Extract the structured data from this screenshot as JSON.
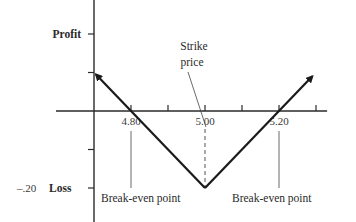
{
  "chart_data": {
    "type": "line",
    "title": "",
    "xlabel": "",
    "ylabel": "",
    "x_tick_labels": [
      {
        "value": 4.8,
        "label": "4.80"
      },
      {
        "value": 5.0,
        "label": "5.00"
      },
      {
        "value": 5.2,
        "label": "5.20"
      }
    ],
    "x_ticks": [
      4.7,
      4.8,
      4.9,
      5.0,
      5.1,
      5.2,
      5.3
    ],
    "y_ticks": [
      0.2,
      0.1,
      -0.1,
      -0.2
    ],
    "y_axis_labels": {
      "profit": {
        "value": 0.2,
        "label": "Profit"
      },
      "loss": {
        "value": -0.2,
        "label": "Loss",
        "number": "–.20"
      }
    },
    "xlim": [
      4.7,
      5.33
    ],
    "ylim": [
      -0.29,
      0.29
    ],
    "series": [
      {
        "name": "Straddle payoff",
        "x": [
          4.7,
          5.0,
          5.29
        ],
        "y": [
          0.1,
          -0.2,
          0.09
        ],
        "arrows_at_ends": true
      }
    ],
    "annotations": [
      {
        "text_lines": [
          "Strike",
          "price"
        ],
        "x": 5.0,
        "points_to": "strike",
        "style": "dashed vertical to vertex"
      },
      {
        "text": "Break-even point",
        "x": 4.8
      },
      {
        "text": "Break-even point",
        "x": 5.2
      }
    ],
    "grid": false,
    "legend": "none"
  }
}
